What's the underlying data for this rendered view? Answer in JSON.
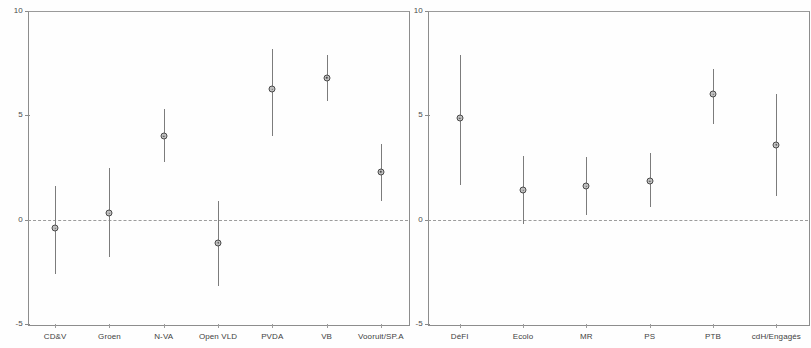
{
  "figure": {
    "kind": "coefficient-point-range-plot",
    "panel_count": 2,
    "ink_color": "#4b4b4b",
    "axis_color": "#8d8d8d",
    "zero_line_color": "#9c9c9c"
  },
  "axis": {
    "y_ticks": [
      "10",
      "5",
      "0",
      "-5"
    ],
    "y_tick_values": [
      10,
      5,
      0,
      -5
    ],
    "ylim": [
      -5,
      10
    ],
    "zero_reference": 0
  },
  "chart_data": [
    {
      "type": "scatter",
      "panel": "left",
      "title": "",
      "xlabel": "",
      "ylabel": "",
      "ylim": [
        -5,
        10
      ],
      "yticks": [
        -5,
        0,
        5,
        10
      ],
      "grid": false,
      "legend": "none",
      "zero_line": 0,
      "categories": [
        "CD&V",
        "Groen",
        "N-VA",
        "Open VLD",
        "PVDA",
        "VB",
        "Vooruit/SP.A"
      ],
      "series": [
        {
          "name": "point estimate",
          "values": [
            -0.4,
            0.3,
            4.0,
            -1.1,
            6.25,
            6.8,
            2.3
          ]
        },
        {
          "name": "lower bound",
          "values": [
            -2.6,
            -1.8,
            2.75,
            -3.2,
            4.0,
            5.7,
            0.9
          ]
        },
        {
          "name": "upper bound",
          "values": [
            1.6,
            2.5,
            5.3,
            0.9,
            8.2,
            7.9,
            3.65
          ]
        }
      ]
    },
    {
      "type": "scatter",
      "panel": "right",
      "title": "",
      "xlabel": "",
      "ylabel": "",
      "ylim": [
        -5,
        10
      ],
      "yticks": [
        -5,
        0,
        5,
        10
      ],
      "grid": false,
      "legend": "none",
      "zero_line": 0,
      "categories": [
        "DéFI",
        "Ecolo",
        "MR",
        "PS",
        "PTB",
        "cdH/Engagés"
      ],
      "series": [
        {
          "name": "point estimate",
          "values": [
            4.85,
            1.4,
            1.6,
            1.85,
            6.0,
            3.6
          ]
        },
        {
          "name": "lower bound",
          "values": [
            1.65,
            -0.2,
            0.2,
            0.6,
            4.6,
            1.15
          ]
        },
        {
          "name": "upper bound",
          "values": [
            7.9,
            3.05,
            3.0,
            3.2,
            7.2,
            6.0
          ]
        }
      ]
    }
  ]
}
